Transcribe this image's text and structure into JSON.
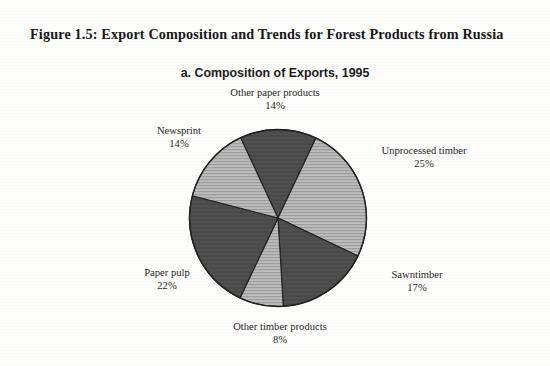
{
  "figure": {
    "title": "Figure 1.5: Export Composition and Trends for Forest Products from Russia"
  },
  "chart_data": {
    "type": "pie",
    "title": "a. Composition of Exports, 1995",
    "subtitle": "a. Composition of Exports, 1995",
    "units": "percent",
    "total": 100,
    "legend": "none (direct slice labels)",
    "start_angle_deg": -25,
    "direction": "clockwise",
    "categories": [
      "Other paper products",
      "Unprocessed timber",
      "Sawntimber",
      "Other timber products",
      "Paper pulp",
      "Newsprint"
    ],
    "values": [
      14,
      25,
      17,
      8,
      22,
      14
    ],
    "labels": [
      "14%",
      "25%",
      "17%",
      "8%",
      "22%",
      "14%"
    ],
    "slices": [
      {
        "name": "Other paper products",
        "value": 14,
        "label": "14%",
        "fill": "#4a4a4a",
        "pattern": "solid",
        "position": "top"
      },
      {
        "name": "Unprocessed timber",
        "value": 25,
        "label": "25%",
        "fill": "#b2b2b2",
        "pattern": "horizontal-hatch",
        "position": "right"
      },
      {
        "name": "Sawntimber",
        "value": 17,
        "label": "17%",
        "fill": "#4a4a4a",
        "pattern": "solid",
        "position": "lower-right"
      },
      {
        "name": "Other timber products",
        "value": 8,
        "label": "8%",
        "fill": "#b2b2b2",
        "pattern": "horizontal-hatch",
        "position": "bottom"
      },
      {
        "name": "Paper pulp",
        "value": 22,
        "label": "22%",
        "fill": "#4a4a4a",
        "pattern": "solid",
        "position": "lower-left"
      },
      {
        "name": "Newsprint",
        "value": 14,
        "label": "14%",
        "fill": "#b2b2b2",
        "pattern": "horizontal-hatch",
        "position": "upper-left"
      }
    ],
    "colors": {
      "dark": "#4a4a4a",
      "light": "#b2b2b2",
      "outline": "#1a1a1a",
      "page": "#fdfdfc"
    }
  }
}
